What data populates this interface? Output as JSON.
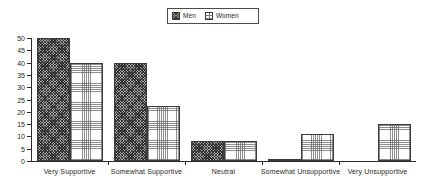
{
  "chart_data": {
    "type": "bar",
    "title": "",
    "xlabel": "",
    "ylabel": "",
    "ylim": [
      0,
      50
    ],
    "yticks": [
      0,
      5,
      10,
      15,
      20,
      25,
      30,
      35,
      40,
      45,
      50
    ],
    "grid": false,
    "legend_position": "top-center",
    "categories": [
      "Very  Supportive",
      "Somewhat  Supportive",
      "Neutral",
      "Somewhat  Unsupportive",
      "Very  Unsupportive"
    ],
    "series": [
      {
        "name": "Men",
        "pattern": "dark-crosshatch",
        "color": "#a6a6a6",
        "values": [
          50,
          40,
          8,
          0.5,
          0
        ]
      },
      {
        "name": "Women",
        "pattern": "light-dotted-grid",
        "color": "#fdfdfd",
        "values": [
          40,
          22.5,
          8,
          11,
          15
        ]
      }
    ]
  },
  "legend": {
    "entries": [
      {
        "label": "Men"
      },
      {
        "label": "Women"
      }
    ]
  },
  "axis": {
    "y_tick_labels": [
      "0",
      "5",
      "10",
      "15",
      "20",
      "25",
      "30",
      "35",
      "40",
      "45",
      "50"
    ]
  }
}
